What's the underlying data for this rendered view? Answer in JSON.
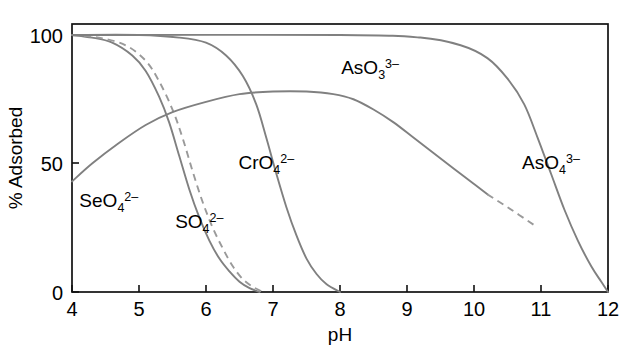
{
  "chart_data": {
    "type": "line",
    "title": "",
    "xlabel": "pH",
    "ylabel": "% Adsorbed",
    "xlim": [
      4,
      12
    ],
    "ylim": [
      0,
      105
    ],
    "grid": false,
    "legend": "inline-annotations",
    "xticks": [
      "4",
      "5",
      "6",
      "7",
      "8",
      "9",
      "10",
      "11",
      "12"
    ],
    "yticks": [
      "0",
      "50",
      "100"
    ],
    "series": [
      {
        "name": "SeO4 2-",
        "label_html": "SeO<tspan class='sub' dy='5'>4</tspan><tspan class='sup' dy='-11'>2–</tspan>",
        "style": "solid",
        "color": "#808080",
        "x": [
          4.0,
          4.3,
          4.6,
          4.9,
          5.1,
          5.3,
          5.45,
          5.6,
          5.75,
          5.9,
          6.05,
          6.2,
          6.35,
          6.5,
          6.65,
          6.8
        ],
        "y": [
          100,
          99,
          97,
          92,
          86,
          76,
          66,
          53,
          40,
          29,
          20,
          13,
          8,
          4,
          1.5,
          0
        ]
      },
      {
        "name": "SO4 2-",
        "label_html": "SO<tspan class='sub' dy='5'>4</tspan><tspan class='sup' dy='-11'>2–</tspan>",
        "style": "dashed",
        "color": "#9a9a9a",
        "x": [
          4.0,
          4.4,
          4.8,
          5.1,
          5.3,
          5.5,
          5.65,
          5.8,
          5.95,
          6.1,
          6.25,
          6.4,
          6.55,
          6.7,
          6.85
        ],
        "y": [
          100,
          99,
          96,
          90,
          82,
          71,
          60,
          47,
          35,
          25,
          17,
          10,
          5,
          2,
          0
        ]
      },
      {
        "name": "CrO4 2-",
        "label_html": "CrO<tspan class='sub' dy='5'>4</tspan><tspan class='sup' dy='-11'>2–</tspan>",
        "style": "solid",
        "color": "#808080",
        "x": [
          4.0,
          5.0,
          5.6,
          6.0,
          6.3,
          6.55,
          6.75,
          6.9,
          7.05,
          7.2,
          7.35,
          7.5,
          7.65,
          7.8,
          8.0
        ],
        "y": [
          100,
          100,
          99,
          97,
          92,
          84,
          73,
          60,
          46,
          33,
          22,
          13,
          7,
          3,
          0
        ]
      },
      {
        "name": "AsO3 3-",
        "label_html": "AsO<tspan class='sub' dy='5'>3</tspan><tspan class='sup' dy='-11'>3–</tspan>",
        "style": "solid-with-dashed-tail",
        "color": "#808080",
        "x": [
          4.0,
          4.3,
          4.7,
          5.1,
          5.5,
          6.0,
          6.5,
          7.0,
          7.5,
          7.9,
          8.2,
          8.5,
          8.8,
          9.1,
          9.4,
          9.7,
          10.0,
          10.2,
          10.5,
          10.9
        ],
        "y": [
          43,
          50,
          58,
          65,
          70,
          74,
          77,
          78,
          78,
          77,
          75,
          71,
          66,
          60,
          54,
          48,
          42,
          38,
          33,
          26
        ],
        "dash_from_x": 10.2
      },
      {
        "name": "AsO4 3-",
        "label_html": "AsO<tspan class='sub' dy='5'>4</tspan><tspan class='sup' dy='-11'>3–</tspan>",
        "style": "solid",
        "color": "#808080",
        "x": [
          4.0,
          8.0,
          9.2,
          9.8,
          10.2,
          10.5,
          10.75,
          10.95,
          11.15,
          11.35,
          11.55,
          11.75,
          11.9,
          12.0
        ],
        "y": [
          100,
          100,
          99,
          96,
          91,
          83,
          73,
          60,
          46,
          32,
          20,
          10,
          4,
          0
        ]
      }
    ],
    "annotations": [
      {
        "text": "SeO4 2-",
        "x": 4.55,
        "y": 33
      },
      {
        "text": "SO4 2-",
        "x": 5.9,
        "y": 25
      },
      {
        "text": "CrO4 2-",
        "x": 6.9,
        "y": 48
      },
      {
        "text": "AsO3 3-",
        "x": 8.45,
        "y": 85
      },
      {
        "text": "AsO4 3-",
        "x": 11.15,
        "y": 48
      }
    ]
  },
  "axes": {
    "x_title": "pH",
    "y_title": "% Adsorbed",
    "x_tick_labels": [
      "4",
      "5",
      "6",
      "7",
      "8",
      "9",
      "10",
      "11",
      "12"
    ],
    "y_tick_labels": [
      "100",
      "50",
      "0"
    ]
  },
  "colors": {
    "curve": "#808080",
    "curve_dashed": "#9a9a9a",
    "axis": "#111111",
    "background": "#ffffff"
  }
}
